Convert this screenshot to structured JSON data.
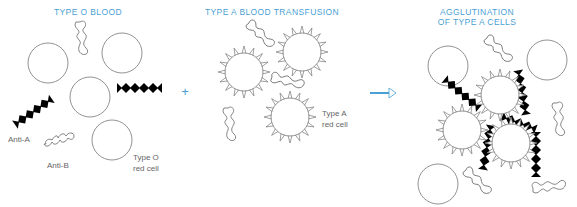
{
  "panels": [
    {
      "title": "TYPE O BLOOD",
      "labels": {
        "anti_a": "Anti-A",
        "anti_b": "Anti-B",
        "cell_line1": "Type O",
        "cell_line2": "red cell"
      }
    },
    {
      "title": "TYPE A BLOOD TRANSFUSION",
      "labels": {
        "cell_line1": "Type A",
        "cell_line2": "red cell"
      }
    },
    {
      "title_line1": "AGGLUTINATION",
      "title_line2": "OF TYPE A CELLS"
    }
  ],
  "operators": {
    "plus": "+",
    "arrow": "arrow-right"
  },
  "colors": {
    "title": "#4a9fd4",
    "arrow": "#4a9fd4",
    "antibody_a": "#000000",
    "outline": "#777777"
  }
}
